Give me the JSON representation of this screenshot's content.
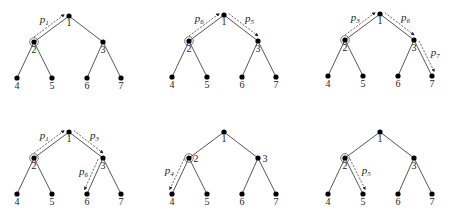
{
  "diagram": {
    "type": "binary-tree-paths",
    "node_labels": [
      "1",
      "2",
      "3",
      "4",
      "5",
      "6",
      "7"
    ],
    "marked_node": "2",
    "trees": [
      {
        "id": "tree-1",
        "paths": [
          {
            "label": "p",
            "sub": "1",
            "from": "2",
            "to": "1"
          }
        ]
      },
      {
        "id": "tree-2",
        "paths": [
          {
            "label": "p",
            "sub": "6",
            "from": "2",
            "to": "1"
          },
          {
            "label": "p",
            "sub": "5",
            "from": "1",
            "to": "3"
          }
        ]
      },
      {
        "id": "tree-3",
        "paths": [
          {
            "label": "p",
            "sub": "3",
            "from": "2",
            "to": "1"
          },
          {
            "label": "p",
            "sub": "6",
            "from": "1",
            "to": "3"
          },
          {
            "label": "p",
            "sub": "7",
            "from": "3",
            "to": "7"
          }
        ]
      },
      {
        "id": "tree-4",
        "paths": [
          {
            "label": "p",
            "sub": "1",
            "from": "2",
            "to": "1"
          },
          {
            "label": "p",
            "sub": "3",
            "from": "1",
            "to": "3"
          },
          {
            "label": "p",
            "sub": "6",
            "from": "3",
            "to": "6"
          }
        ]
      },
      {
        "id": "tree-5",
        "paths": [
          {
            "label": "p",
            "sub": "4",
            "from": "2",
            "to": "4"
          }
        ]
      },
      {
        "id": "tree-6",
        "paths": [
          {
            "label": "p",
            "sub": "5",
            "from": "2",
            "to": "5"
          }
        ]
      }
    ]
  }
}
